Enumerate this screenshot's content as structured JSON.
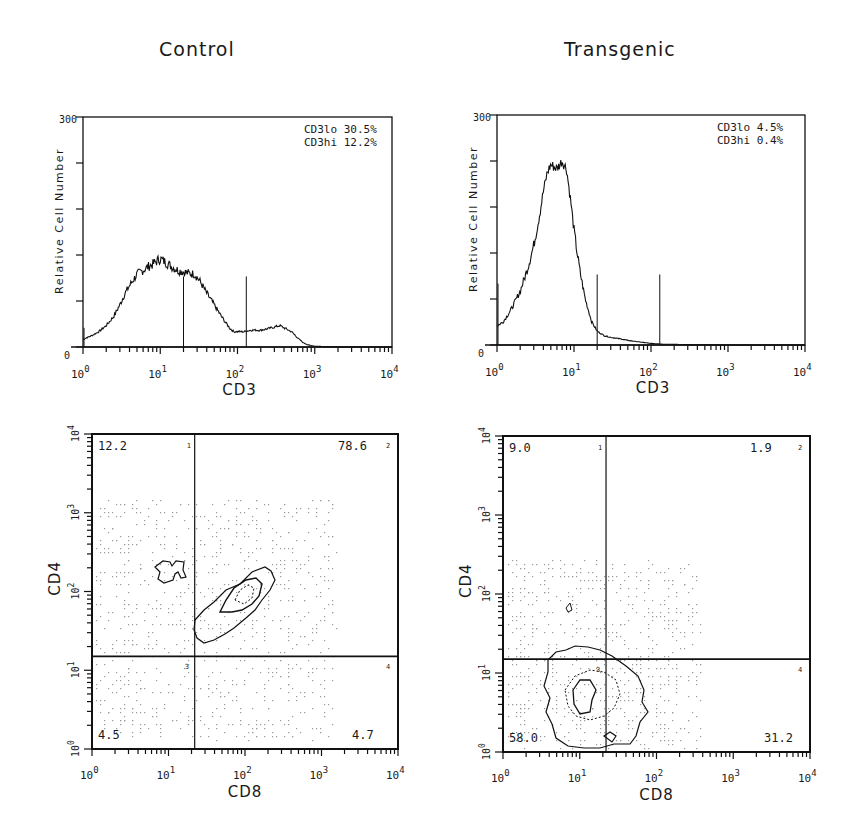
{
  "columns": [
    {
      "title": "Control"
    },
    {
      "title": "Transgenic"
    }
  ],
  "chart_data": [
    {
      "id": "control-histogram",
      "type": "line",
      "title": "Control",
      "xlabel": "CD3",
      "ylabel": "Relative Cell Number",
      "xscale": "log",
      "xlim": [
        1,
        10000
      ],
      "ylim": [
        0,
        300
      ],
      "x_ticks": [
        "10^0",
        "10^1",
        "10^2",
        "10^3",
        "10^4"
      ],
      "y_ticks": [
        "0",
        "300"
      ],
      "gates": [
        20,
        130
      ],
      "annotations": [
        {
          "label": "CD3lo",
          "value": "30.5%"
        },
        {
          "label": "CD3hi",
          "value": "12.2%"
        }
      ],
      "x": [
        1,
        1.3,
        1.6,
        2,
        2.5,
        3,
        3.5,
        4,
        5,
        6,
        7,
        8,
        9,
        10,
        12,
        14,
        17,
        20,
        24,
        28,
        33,
        40,
        50,
        60,
        70,
        80,
        90,
        100,
        120,
        150,
        200,
        250,
        300,
        350,
        400,
        500,
        600,
        700,
        800,
        1000,
        2000,
        10000
      ],
      "y": [
        10,
        15,
        20,
        28,
        40,
        55,
        70,
        80,
        95,
        100,
        105,
        108,
        112,
        115,
        110,
        105,
        100,
        98,
        96,
        95,
        85,
        70,
        55,
        42,
        32,
        24,
        20,
        20,
        20,
        22,
        22,
        24,
        26,
        28,
        25,
        20,
        12,
        6,
        3,
        1,
        0,
        0
      ]
    },
    {
      "id": "transgenic-histogram",
      "type": "line",
      "title": "Transgenic",
      "xlabel": "CD3",
      "ylabel": "Relative Cell Number",
      "xscale": "log",
      "xlim": [
        1,
        10000
      ],
      "ylim": [
        0,
        300
      ],
      "x_ticks": [
        "10^0",
        "10^1",
        "10^2",
        "10^3",
        "10^4"
      ],
      "y_ticks": [
        "0",
        "300"
      ],
      "gates": [
        20,
        130
      ],
      "annotations": [
        {
          "label": "CD3lo",
          "value": "4.5%"
        },
        {
          "label": "CD3hi",
          "value": "0.4%"
        }
      ],
      "x": [
        1,
        1.2,
        1.5,
        2,
        2.5,
        3,
        3.5,
        4,
        4.5,
        5,
        6,
        7,
        8,
        9,
        10,
        11,
        12,
        14,
        17,
        20,
        25,
        30,
        40,
        50,
        70,
        100,
        150,
        300,
        1000,
        10000
      ],
      "y": [
        25,
        30,
        45,
        70,
        100,
        130,
        165,
        200,
        225,
        235,
        230,
        240,
        230,
        190,
        150,
        120,
        95,
        60,
        30,
        18,
        12,
        10,
        8,
        6,
        4,
        2,
        1,
        0.5,
        0,
        0
      ]
    },
    {
      "id": "control-dotplot",
      "type": "scatter",
      "title": "Control",
      "xlabel": "CD8",
      "ylabel": "CD4",
      "xscale": "log",
      "yscale": "log",
      "xlim": [
        1,
        10000
      ],
      "ylim": [
        1,
        10000
      ],
      "x_ticks": [
        "10^0",
        "10^1",
        "10^2",
        "10^3",
        "10^4"
      ],
      "y_ticks": [
        "10^0",
        "10^1",
        "10^2",
        "10^3",
        "10^4"
      ],
      "quadrant_divider": {
        "x": 22,
        "y": 15
      },
      "quadrants": [
        {
          "id": "1",
          "position": "upper-left",
          "value": "12.2"
        },
        {
          "id": "2",
          "position": "upper-right",
          "value": "78.6"
        },
        {
          "id": "3",
          "position": "lower-left",
          "value": "4.5"
        },
        {
          "id": "4",
          "position": "lower-right",
          "value": "4.7"
        }
      ]
    },
    {
      "id": "transgenic-dotplot",
      "type": "scatter",
      "title": "Transgenic",
      "xlabel": "CD8",
      "ylabel": "CD4",
      "xscale": "log",
      "yscale": "log",
      "xlim": [
        1,
        10000
      ],
      "ylim": [
        1,
        10000
      ],
      "x_ticks": [
        "10^0",
        "10^1",
        "10^2",
        "10^3",
        "10^4"
      ],
      "y_ticks": [
        "10^0",
        "10^1",
        "10^2",
        "10^3",
        "10^4"
      ],
      "quadrant_divider": {
        "x": 22,
        "y": 15
      },
      "quadrants": [
        {
          "id": "1",
          "position": "upper-left",
          "value": "9.0"
        },
        {
          "id": "2",
          "position": "upper-right",
          "value": "1.9"
        },
        {
          "id": "3",
          "position": "lower-left",
          "value": "58.0"
        },
        {
          "id": "4",
          "position": "lower-right",
          "value": "31.2"
        }
      ]
    }
  ],
  "labels": {
    "hist_ylabel": "Relative Cell Number",
    "hist_xlabel": "CD3",
    "dot_xlabel": "CD8",
    "dot_ylabel": "CD4",
    "y_top": "300",
    "y_zero": "0",
    "tick_base": "10",
    "tick_exps": [
      "0",
      "1",
      "2",
      "3",
      "4"
    ],
    "control_cd3lo": "CD3lo  30.5%",
    "control_cd3hi": "CD3hi  12.2%",
    "tg_cd3lo": "CD3lo  4.5%",
    "tg_cd3hi": "CD3hi  0.4%"
  }
}
